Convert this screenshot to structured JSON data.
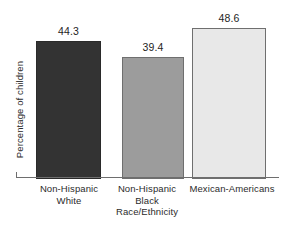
{
  "chart_data": {
    "type": "bar",
    "title": "",
    "subtitle": "",
    "xlabel": "Race/Ethnicity",
    "ylabel": "Percentage of children",
    "categories": [
      "Non-Hispanic White",
      "Non-Hispanic Black",
      "Mexican-Americans"
    ],
    "category_lines": [
      [
        "Non-Hispanic",
        "White"
      ],
      [
        "Non-Hispanic",
        "Black"
      ],
      [
        "Mexican-Americans"
      ]
    ],
    "values": [
      44.3,
      39.4,
      48.6
    ],
    "value_labels": [
      "44.3",
      "39.4",
      "48.6"
    ],
    "ylim": [
      0,
      55
    ],
    "grid": false,
    "legend": false,
    "legend_position": "none",
    "axis_ticks_y": [],
    "bar_colors": [
      "#333333",
      "#9c9c9c",
      "#e8e8e8"
    ],
    "bar_border_colors": [
      "#2a2a2a",
      "#6f6f6f",
      "#6f6f6f"
    ]
  },
  "axis": {
    "line_color": "#6e6e6e"
  }
}
